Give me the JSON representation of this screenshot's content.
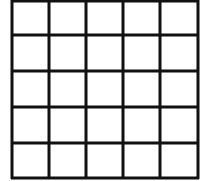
{
  "diagram": {
    "type": "grid",
    "rows": 5,
    "cols": 5,
    "line_color": "#111111",
    "background": "#ffffff",
    "x_lines": [
      12,
      49,
      86,
      123,
      160,
      198
    ],
    "y_lines": [
      1,
      35,
      71,
      107,
      143,
      178
    ],
    "stroke_width": 3
  }
}
